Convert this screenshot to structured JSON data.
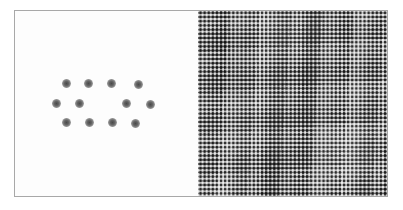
{
  "figure": {
    "title": "",
    "caption": "",
    "frame_color": "#a8a8a8",
    "background_color": "#ffffff",
    "width": 403,
    "height": 210
  },
  "panels": [
    {
      "id": "left",
      "name": "real-space-dot-lattice",
      "label": "",
      "background_color": "#fdfdfd",
      "dot_color": "#5a5a5a",
      "dot_count": 12,
      "dot_diameter_px": 9
    },
    {
      "id": "right",
      "name": "reciprocal-space-moire-pattern",
      "label": "",
      "base_gray": "#8b8b8b",
      "pattern": "moire-checkerboard",
      "cell_spacing_px": 4
    }
  ],
  "chart_data": {
    "type": "scatter",
    "title": "",
    "subtitle": "",
    "xlabel": "",
    "ylabel": "",
    "xlim": [
      0,
      183
    ],
    "ylim": [
      0,
      187
    ],
    "grid": false,
    "legend": null,
    "annotations": [],
    "series": [
      {
        "name": "lattice-points",
        "marker": "blurred-disc",
        "color": "#5a5a5a",
        "points": [
          {
            "row": 1,
            "col": 1,
            "x": 51,
            "y": 72
          },
          {
            "row": 1,
            "col": 2,
            "x": 73,
            "y": 72
          },
          {
            "row": 1,
            "col": 3,
            "x": 96,
            "y": 72
          },
          {
            "row": 1,
            "col": 4,
            "x": 123,
            "y": 73
          },
          {
            "row": 2,
            "col": 1,
            "x": 41,
            "y": 92
          },
          {
            "row": 2,
            "col": 2,
            "x": 64,
            "y": 92
          },
          {
            "row": 2,
            "col": 3,
            "x": 111,
            "y": 92
          },
          {
            "row": 2,
            "col": 4,
            "x": 135,
            "y": 93
          },
          {
            "row": 3,
            "col": 1,
            "x": 51,
            "y": 111
          },
          {
            "row": 3,
            "col": 2,
            "x": 74,
            "y": 111
          },
          {
            "row": 3,
            "col": 3,
            "x": 97,
            "y": 111
          },
          {
            "row": 3,
            "col": 4,
            "x": 120,
            "y": 112
          }
        ]
      }
    ],
    "rows": [
      {
        "row": 1,
        "count": 4
      },
      {
        "row": 2,
        "count": 4
      },
      {
        "row": 3,
        "count": 4
      }
    ]
  }
}
